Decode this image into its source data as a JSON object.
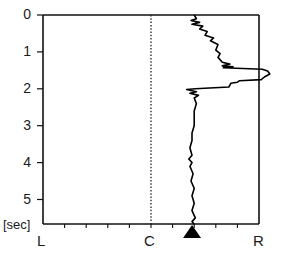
{
  "chart_data": {
    "type": "line",
    "title": "",
    "orientation": "vertical-time",
    "ylabel": "[sec]",
    "xlabel": "",
    "y_ticks": [
      "0",
      "1",
      "2",
      "3",
      "4",
      "5"
    ],
    "ylim": [
      0,
      5.67
    ],
    "x_tick_labels": [
      "L",
      "C",
      "R"
    ],
    "xlim": [
      -1,
      1
    ],
    "grid": false,
    "center_line": {
      "position": 0,
      "style": "dotted"
    },
    "marker": {
      "shape": "triangle-up",
      "x": 0.38,
      "note": "filled triangle below x-axis"
    },
    "series": [
      {
        "name": "position",
        "color": "#000000",
        "points": [
          [
            0.0,
            0.4
          ],
          [
            0.1,
            0.42
          ],
          [
            0.15,
            0.37
          ],
          [
            0.2,
            0.45
          ],
          [
            0.25,
            0.38
          ],
          [
            0.3,
            0.48
          ],
          [
            0.38,
            0.45
          ],
          [
            0.45,
            0.52
          ],
          [
            0.55,
            0.5
          ],
          [
            0.62,
            0.58
          ],
          [
            0.7,
            0.55
          ],
          [
            0.8,
            0.62
          ],
          [
            0.95,
            0.6
          ],
          [
            1.05,
            0.64
          ],
          [
            1.15,
            0.62
          ],
          [
            1.28,
            0.66
          ],
          [
            1.33,
            0.73
          ],
          [
            1.38,
            0.66
          ],
          [
            1.4,
            0.76
          ],
          [
            1.43,
            0.67
          ],
          [
            1.47,
            1.03
          ],
          [
            1.52,
            1.08
          ],
          [
            1.6,
            1.1
          ],
          [
            1.68,
            1.05
          ],
          [
            1.75,
            1.02
          ],
          [
            1.78,
            0.82
          ],
          [
            1.82,
            0.8
          ],
          [
            1.85,
            0.74
          ],
          [
            1.95,
            0.72
          ],
          [
            2.0,
            0.41
          ],
          [
            2.02,
            0.33
          ],
          [
            2.08,
            0.42
          ],
          [
            2.12,
            0.36
          ],
          [
            2.18,
            0.44
          ],
          [
            2.25,
            0.4
          ],
          [
            2.4,
            0.42
          ],
          [
            2.6,
            0.4
          ],
          [
            2.8,
            0.4
          ],
          [
            3.0,
            0.4
          ],
          [
            3.2,
            0.38
          ],
          [
            3.4,
            0.38
          ],
          [
            3.6,
            0.36
          ],
          [
            3.8,
            0.38
          ],
          [
            3.9,
            0.35
          ],
          [
            4.0,
            0.38
          ],
          [
            4.1,
            0.36
          ],
          [
            4.3,
            0.39
          ],
          [
            4.5,
            0.37
          ],
          [
            4.7,
            0.4
          ],
          [
            4.9,
            0.38
          ],
          [
            5.1,
            0.4
          ],
          [
            5.3,
            0.38
          ],
          [
            5.5,
            0.41
          ],
          [
            5.6,
            0.38
          ],
          [
            5.67,
            0.4
          ]
        ]
      }
    ]
  },
  "axes": {
    "y_unit": "[sec]",
    "x_left": "L",
    "x_center": "C",
    "x_right": "R"
  }
}
